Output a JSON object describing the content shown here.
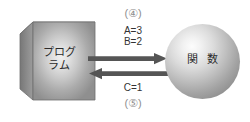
{
  "diagram": {
    "background_color": "#ffffff",
    "cube": {
      "label": "プログ\nラム",
      "shape_name": "cube",
      "face_color": "#b5b5b5",
      "top_color": "#9a9a9a",
      "side_color": "#808080",
      "edge_color": "#6e6e6e"
    },
    "sphere": {
      "label": "関 数",
      "shape_name": "sphere",
      "fill_color": "#bdbdbd",
      "highlight_color": "#fcfcfc",
      "shadow_color": "#7e7e7e"
    },
    "arrows": {
      "forward": {
        "direction": "right",
        "color": "#555555",
        "step_label": "(④)",
        "params": "A=3\nB=2"
      },
      "backward": {
        "direction": "left",
        "color": "#555555",
        "step_label": "(⑤)",
        "params": "C=1"
      }
    }
  }
}
